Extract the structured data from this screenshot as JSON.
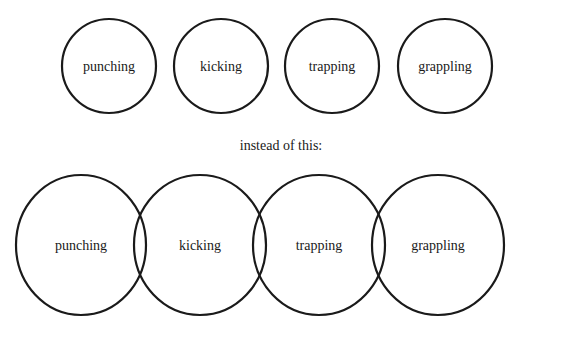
{
  "top_row": {
    "circles": [
      {
        "label": "punching",
        "cx": 109,
        "cy": 66,
        "r": 47
      },
      {
        "label": "kicking",
        "cx": 221,
        "cy": 66,
        "r": 47
      },
      {
        "label": "trapping",
        "cx": 332,
        "cy": 66,
        "r": 47
      },
      {
        "label": "grappling",
        "cx": 445,
        "cy": 66,
        "r": 47
      }
    ]
  },
  "caption": "instead of this:",
  "bottom_row": {
    "circles": [
      {
        "label": "punching",
        "cx": 81,
        "cy": 245,
        "r": 67
      },
      {
        "label": "kicking",
        "cx": 200,
        "cy": 245,
        "r": 67
      },
      {
        "label": "trapping",
        "cx": 319,
        "cy": 245,
        "r": 67
      },
      {
        "label": "grappling",
        "cx": 438,
        "cy": 245,
        "r": 67
      }
    ]
  },
  "colors": {
    "stroke": "#1a1a1a",
    "background": "#ffffff"
  }
}
